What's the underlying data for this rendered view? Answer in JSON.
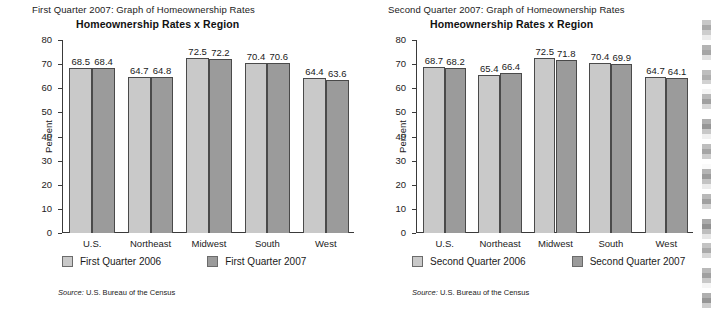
{
  "document": {
    "background": "#ffffff",
    "scan_edge_artifact": true
  },
  "palette": {
    "series_2006": "#c9c9c9",
    "series_2007": "#9b9b9b",
    "axis": "#3a3a3a",
    "bar_outline": "#4a4a4a",
    "text": "#1a1a1a"
  },
  "panels": [
    {
      "id": "first-quarter",
      "caption": "First Quarter 2007: Graph of Homeownership Rates",
      "subtitle": "Homeownership Rates x Region",
      "source_prefix": "Source:",
      "source_text": "U.S. Bureau of the Census",
      "legend": [
        {
          "label": "First Quarter 2006",
          "color": "#c9c9c9"
        },
        {
          "label": "First Quarter 2007",
          "color": "#9b9b9b"
        }
      ]
    },
    {
      "id": "second-quarter",
      "caption": "Second Quarter 2007: Graph of Homeownership Rates",
      "subtitle": "Homeownership Rates x Region",
      "source_prefix": "Source:",
      "source_text": "U.S. Bureau of the Census",
      "legend": [
        {
          "label": "Second Quarter 2006",
          "color": "#c9c9c9"
        },
        {
          "label": "Second Quarter 2007",
          "color": "#9b9b9b"
        }
      ]
    }
  ],
  "chart_data": [
    {
      "type": "bar",
      "title": "Homeownership Rates x Region",
      "subtitle": "First Quarter 2007: Graph of Homeownership Rates",
      "xlabel": "",
      "ylabel": "Percent",
      "ylim": [
        0,
        80
      ],
      "yticks": [
        0,
        10,
        20,
        30,
        40,
        50,
        60,
        70,
        80
      ],
      "ytick_labels": [
        "0",
        "10",
        "20",
        "30",
        "40",
        "50",
        "60",
        "70",
        "80"
      ],
      "grid": false,
      "legend_position": "below",
      "categories": [
        "U.S.",
        "Northeast",
        "Midwest",
        "South",
        "West"
      ],
      "series": [
        {
          "name": "First Quarter 2006",
          "color": "#c9c9c9",
          "values": [
            68.5,
            64.7,
            72.5,
            70.4,
            64.4
          ]
        },
        {
          "name": "First Quarter 2007",
          "color": "#9b9b9b",
          "values": [
            68.4,
            64.8,
            72.2,
            70.6,
            63.6
          ]
        }
      ],
      "source": "Source: U.S. Bureau of the Census"
    },
    {
      "type": "bar",
      "title": "Homeownership Rates x Region",
      "subtitle": "Second Quarter 2007: Graph of Homeownership Rates",
      "xlabel": "",
      "ylabel": "Percent",
      "ylim": [
        0,
        80
      ],
      "yticks": [
        0,
        10,
        20,
        30,
        40,
        50,
        60,
        70,
        80
      ],
      "ytick_labels": [
        "0",
        "10",
        "20",
        "30",
        "40",
        "50",
        "60",
        "70",
        "80"
      ],
      "grid": false,
      "legend_position": "below",
      "categories": [
        "U.S.",
        "Northeast",
        "Midwest",
        "South",
        "West"
      ],
      "series": [
        {
          "name": "Second Quarter 2006",
          "color": "#c9c9c9",
          "values": [
            68.7,
            65.4,
            72.5,
            70.4,
            64.7
          ]
        },
        {
          "name": "Second Quarter 2007",
          "color": "#9b9b9b",
          "values": [
            68.2,
            66.4,
            71.8,
            69.9,
            64.1
          ]
        }
      ],
      "source": "Source: U.S. Bureau of the Census"
    }
  ]
}
